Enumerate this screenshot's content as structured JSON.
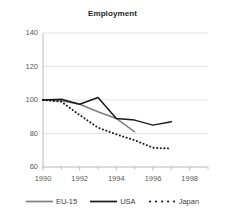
{
  "chart_data": {
    "type": "line",
    "title": "Employment",
    "xlabel": "",
    "ylabel": "",
    "x": [
      1990,
      1991,
      1992,
      1993,
      1994,
      1995,
      1996,
      1997
    ],
    "series": [
      {
        "name": "EU-15",
        "color": "#7f7f7f",
        "style": "solid",
        "x": [
          1990,
          1991,
          1992,
          1993,
          1994,
          1995
        ],
        "values": [
          100,
          99.5,
          97.5,
          93,
          89,
          81
        ]
      },
      {
        "name": "USA",
        "color": "#1a1a1a",
        "style": "solid",
        "x": [
          1990,
          1991,
          1992,
          1993,
          1994,
          1995,
          1996,
          1997
        ],
        "values": [
          100,
          100.5,
          97.5,
          101.5,
          89,
          88,
          85,
          87
        ]
      },
      {
        "name": "Japan",
        "color": "#111111",
        "style": "dotted",
        "x": [
          1990,
          1991,
          1992,
          1993,
          1994,
          1995,
          1996,
          1997
        ],
        "values": [
          100,
          99,
          91,
          83.5,
          79.5,
          76,
          71.5,
          71
        ]
      }
    ],
    "xlim": [
      1990,
      1999
    ],
    "ylim": [
      60,
      140
    ],
    "yticks": [
      60,
      80,
      100,
      120,
      140
    ],
    "xticks": [
      1990,
      1992,
      1994,
      1996,
      1998
    ],
    "xminorticks": [
      1991,
      1993,
      1995,
      1997,
      1999
    ],
    "grid": "horizontal",
    "legend_position": "bottom"
  },
  "axis": {
    "y_tick_labels": [
      "140",
      "120",
      "100",
      "80",
      "60"
    ],
    "x_tick_labels": [
      "1990",
      "1992",
      "1994",
      "1996",
      "1998"
    ]
  },
  "legend": {
    "items": [
      {
        "label": "EU-15"
      },
      {
        "label": "USA"
      },
      {
        "label": "Japan"
      }
    ]
  },
  "colors": {
    "eu": "#7f7f7f",
    "usa": "#1a1a1a",
    "japan": "#111111",
    "grid": "#d9d9d9",
    "axis": "#a6a6a6",
    "text": "#595959",
    "title": "#262626"
  }
}
